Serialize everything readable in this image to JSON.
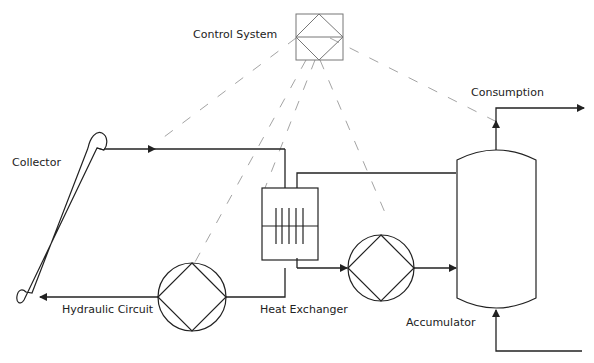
{
  "diagram": {
    "type": "solar thermal hydraulic schematic",
    "colors": {
      "line": "#222222",
      "control_dash": "#999999",
      "background": "#ffffff"
    },
    "labels": {
      "control_system": "Control System",
      "collector": "Collector",
      "hydraulic_circuit": "Hydraulic Circuit",
      "heat_exchanger": "Heat Exchanger",
      "accumulator": "Accumulator",
      "consumption": "Consumption"
    },
    "components": [
      {
        "id": "control-system",
        "label": "Control System",
        "symbol": "square-with-diamond"
      },
      {
        "id": "collector",
        "label": "Collector",
        "symbol": "tilted-tube"
      },
      {
        "id": "pump-1",
        "label": "",
        "symbol": "circle-with-diamond"
      },
      {
        "id": "heat-exchanger",
        "label": "Heat Exchanger",
        "symbol": "box-with-plates"
      },
      {
        "id": "pump-2",
        "label": "",
        "symbol": "circle-with-diamond"
      },
      {
        "id": "accumulator",
        "label": "Accumulator",
        "symbol": "vertical-tank"
      }
    ],
    "connections": [
      {
        "from": "collector",
        "to": "heat-exchanger",
        "style": "solid",
        "arrow": "right"
      },
      {
        "from": "pump-1",
        "to": "collector",
        "style": "solid",
        "arrow": "left",
        "label": "Hydraulic Circuit"
      },
      {
        "from": "heat-exchanger",
        "to": "pump-1",
        "style": "solid"
      },
      {
        "from": "heat-exchanger",
        "to": "pump-2",
        "style": "solid",
        "arrow": "right"
      },
      {
        "from": "pump-2",
        "to": "accumulator",
        "style": "solid",
        "arrow": "right"
      },
      {
        "from": "accumulator",
        "to": "heat-exchanger",
        "style": "solid"
      },
      {
        "from": "accumulator",
        "to": "consumption",
        "style": "solid",
        "arrow": "up/right"
      },
      {
        "from": "supply",
        "to": "accumulator",
        "style": "solid",
        "arrow": "up"
      },
      {
        "from": "control-system",
        "to": "collector",
        "style": "dashed"
      },
      {
        "from": "control-system",
        "to": "heat-exchanger",
        "style": "dashed"
      },
      {
        "from": "control-system",
        "to": "pump-1",
        "style": "dashed"
      },
      {
        "from": "control-system",
        "to": "pump-2",
        "style": "dashed"
      },
      {
        "from": "control-system",
        "to": "consumption",
        "style": "dashed"
      }
    ]
  }
}
